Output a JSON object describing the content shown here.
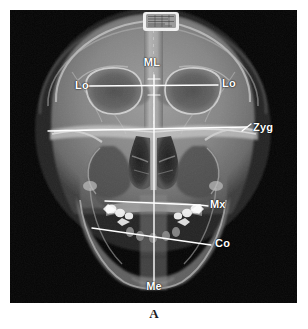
{
  "figure": {
    "caption": "A",
    "modality": "posteroanterior-cephalometric-radiograph",
    "frame": {
      "x": 10,
      "y": 10,
      "width": 287,
      "height": 293
    }
  },
  "colors": {
    "page_background": "#ffffff",
    "plate_background": "#050505",
    "annotation_line": "#ffffff",
    "annotation_text": "#ffffff",
    "caption_text": "#1c1c1c",
    "bone_mid": "#8e8e8e",
    "bone_bright": "#e4e4e4",
    "soft_tissue": "#5a5a5a",
    "air_dark": "#141414"
  },
  "marker_plate": {
    "name": "identification-marker-plate",
    "x": 133,
    "y": 2,
    "width": 36,
    "height": 19
  },
  "landmarks": [
    {
      "id": "ml",
      "label": "ML",
      "name": "midline-reference",
      "label_x": 152,
      "label_y": 65,
      "anchor": "center",
      "line": {
        "type": "vertical",
        "x1": 154,
        "y1": 75,
        "x2": 154,
        "y2": 285
      }
    },
    {
      "id": "lo-left",
      "label": "Lo",
      "name": "latero-orbitale-left",
      "label_x": 75,
      "label_y": 87,
      "anchor": "start",
      "line": {
        "type": "horizontal",
        "x1": 88,
        "y1": 86,
        "x2": 218,
        "y2": 85
      }
    },
    {
      "id": "lo-right",
      "label": "Lo",
      "name": "latero-orbitale-right",
      "label_x": 222,
      "label_y": 85,
      "anchor": "start",
      "line": null
    },
    {
      "id": "zyg",
      "label": "Zyg",
      "name": "zygomatic-reference",
      "label_x": 253,
      "label_y": 129,
      "anchor": "start",
      "line": {
        "type": "horizontal",
        "x1": 48,
        "y1": 131,
        "x2": 247,
        "y2": 127
      },
      "leader": {
        "x1": 242,
        "y1": 131,
        "x2": 251,
        "y2": 124
      }
    },
    {
      "id": "mx",
      "label": "Mx",
      "name": "maxillary-reference",
      "label_x": 210,
      "label_y": 206,
      "anchor": "start",
      "line": {
        "type": "horizontal",
        "x1": 105,
        "y1": 201,
        "x2": 200,
        "y2": 205
      },
      "leader": {
        "x1": 200,
        "y1": 205,
        "x2": 208,
        "y2": 206
      }
    },
    {
      "id": "co",
      "label": "Co",
      "name": "condylar-reference",
      "label_x": 215,
      "label_y": 245,
      "anchor": "start",
      "line": {
        "type": "oblique",
        "x1": 92,
        "y1": 228,
        "x2": 211,
        "y2": 245
      }
    },
    {
      "id": "me",
      "label": "Me",
      "name": "menton-reference",
      "label_x": 154,
      "label_y": 288,
      "anchor": "center",
      "line": null
    }
  ]
}
